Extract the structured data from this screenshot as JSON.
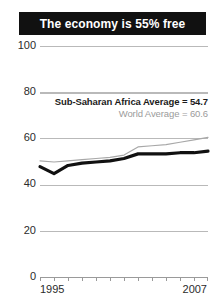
{
  "title": {
    "text": "The economy is 55% free"
  },
  "legend": {
    "primary": "Sub-Saharan Africa Average = 54.7",
    "secondary": "World Average = 60.6"
  },
  "axis": {
    "y_ticks": [
      "100",
      "80",
      "60",
      "40",
      "20",
      "0"
    ],
    "x_start_label": "1995",
    "x_end_label": "2007"
  },
  "colors": {
    "banner_bg": "#111111",
    "banner_text": "#ffffff",
    "primary_series": "#111111",
    "secondary_series": "#a8a8a8",
    "gridline": "#b9b9b9",
    "tick_text": "#2b2b2b",
    "secondary_text": "#9b9b9b"
  },
  "chart_data": {
    "type": "line",
    "title": "The economy is 55% free",
    "xlabel": "",
    "ylabel": "",
    "xlim": [
      1995,
      2007
    ],
    "ylim": [
      0,
      100
    ],
    "yticks": [
      0,
      20,
      40,
      60,
      80,
      100
    ],
    "xticks": [
      1995,
      1996,
      1997,
      1998,
      1999,
      2000,
      2001,
      2002,
      2003,
      2004,
      2005,
      2006,
      2007
    ],
    "grid": true,
    "legend_position": "inside-top-right",
    "annotations": [
      "Sub-Saharan Africa Average = 54.7",
      "World Average = 60.6"
    ],
    "x": [
      1995,
      1996,
      1997,
      1998,
      1999,
      2000,
      2001,
      2002,
      2003,
      2004,
      2005,
      2006,
      2007
    ],
    "series": [
      {
        "name": "Sub-Saharan Africa Average",
        "color": "#111111",
        "emphasis": "bold",
        "values": [
          48.0,
          45.0,
          48.5,
          49.5,
          50.0,
          50.5,
          51.5,
          53.5,
          53.5,
          53.5,
          54.0,
          54.0,
          54.7
        ]
      },
      {
        "name": "World Average",
        "color": "#a8a8a8",
        "emphasis": "thin",
        "values": [
          50.5,
          50.0,
          50.5,
          51.0,
          51.5,
          52.0,
          53.0,
          56.5,
          57.0,
          57.5,
          58.5,
          59.5,
          60.6
        ]
      }
    ]
  }
}
